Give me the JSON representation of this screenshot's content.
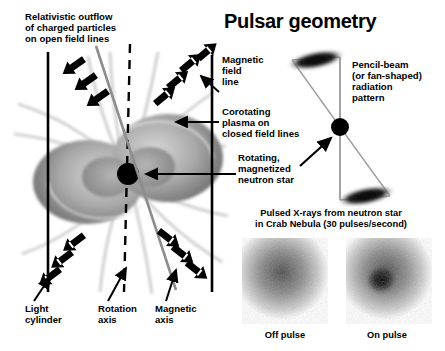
{
  "figure": {
    "title": "Pulsar geometry",
    "type": "scientific-diagram",
    "background": "#ffffff"
  },
  "labels": {
    "outflow": "Relativistic outflow\nof charged particles\non open field lines",
    "magnetic_field_line": "Magnetic\nfield\nline",
    "corotating_plasma": "Corotating\nplasma on\nclosed field lines",
    "rotating_star": "Rotating,\nmagnetized\nneutron star",
    "pencil_beam": "Pencil-beam\n(or fan-shaped)\nradiation\npattern",
    "light_cylinder": "Light\ncylinder",
    "rotation_axis": "Rotation\naxis",
    "magnetic_axis": "Magnetic\naxis"
  },
  "xray_panel": {
    "caption": "Pulsed X-rays from neutron star\nin Crab Nebula (30 pulses/second)",
    "images": [
      {
        "name": "off-pulse",
        "caption": "Off pulse"
      },
      {
        "name": "on-pulse",
        "caption": "On pulse"
      }
    ]
  },
  "colors": {
    "ink": "#000000",
    "plasma_light": "#c9c9c9",
    "plasma_mid": "#9a9a9a",
    "plasma_dark": "#6f6f6f",
    "field_line": "#b9b9b9",
    "axis_gray": "#8d8d8d"
  }
}
